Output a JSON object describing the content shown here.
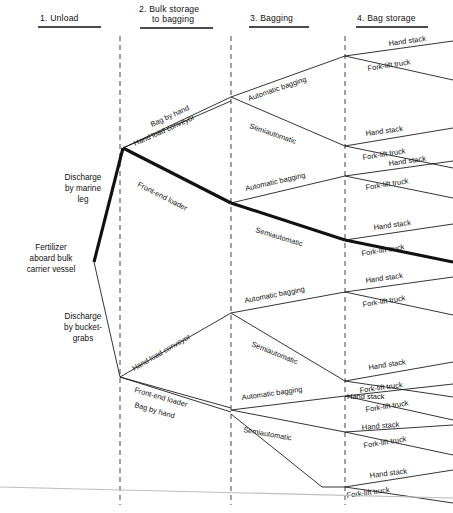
{
  "diagram": {
    "root": {
      "label_lines": [
        "Fertilizer",
        "aboard bulk",
        "carrier vessel"
      ]
    },
    "stage_headers": [
      {
        "number": "1.",
        "name": "Unload",
        "lines": [
          "1.  Unload"
        ]
      },
      {
        "number": "2.",
        "name": "Bulk storage to bagging",
        "lines": [
          "2.  Bulk storage",
          "to bagging"
        ]
      },
      {
        "number": "3.",
        "name": "Bagging",
        "lines": [
          "3.  Bagging"
        ]
      },
      {
        "number": "4.",
        "name": "Bag storage",
        "lines": [
          "4.  Bag storage"
        ]
      }
    ],
    "unload_options": [
      {
        "lines": [
          "Discharge",
          "by marine",
          "leg"
        ],
        "bold": true
      },
      {
        "lines": [
          "Discharge",
          "by bucket-",
          "grabs"
        ],
        "bold": false
      }
    ],
    "transfer_options": [
      "Bag by hand",
      "Hand load conveyor",
      "Front-end loader"
    ],
    "bagging_options": [
      "Automatic bagging",
      "Semiautomatic"
    ],
    "storage_options": [
      "Hand stack",
      "Fork-lift truck"
    ],
    "highlighted_path": [
      "Discharge by marine leg",
      "Front-end loader",
      "Semiautomatic",
      "Fork-lift truck"
    ],
    "colors": {
      "ink": "#111111",
      "divider": "#555555",
      "baseline": "#bdbdbd",
      "background": "#ffffff"
    },
    "edges": {
      "top_transfer": [
        "Bag by hand",
        "Hand load conveyor",
        "Front-end loader"
      ],
      "bottom_transfer": [
        "Hand load conveyor",
        "Front-end loader",
        "Bag by hand"
      ]
    },
    "leaves": [
      "Hand stack",
      "Fork-lift truck",
      "Hand stack",
      "Fork-lift truck",
      "Hand stack",
      "Fork-lift truck",
      "Hand stack",
      "Fork-lift truck",
      "Hand stack",
      "Fork-lift truck",
      "Hand stack",
      "Fork-lift truck",
      "Hand stack",
      "Fork-lift truck",
      "Hand stack",
      "Fork-lift truck"
    ]
  }
}
